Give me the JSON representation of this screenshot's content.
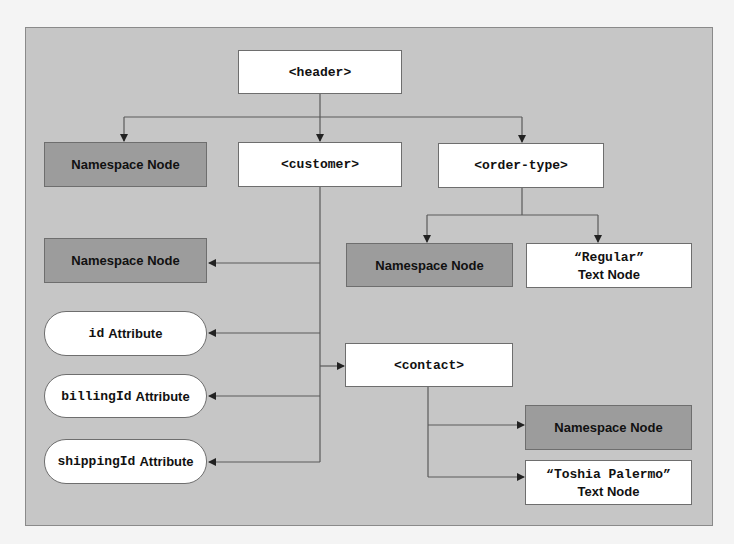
{
  "diagram": {
    "title_partial": "",
    "colors": {
      "panel": "#c6c6c6",
      "element_fill": "#ffffff",
      "namespace_fill": "#9c9c9c",
      "line": "#5a5a5a"
    },
    "nodes": {
      "header": {
        "label": "<header>",
        "type": "element"
      },
      "header_ns": {
        "label": "Namespace Node",
        "type": "namespace"
      },
      "customer": {
        "label": "<customer>",
        "type": "element"
      },
      "order_type": {
        "label": "<order-type>",
        "type": "element"
      },
      "order_type_ns": {
        "label": "Namespace Node",
        "type": "namespace"
      },
      "order_type_text": {
        "value": "“Regular”",
        "kind": "Text Node",
        "type": "text"
      },
      "customer_ns": {
        "label": "Namespace Node",
        "type": "namespace"
      },
      "id_attr": {
        "name": "id",
        "kind": "Attribute",
        "type": "attribute"
      },
      "billing_attr": {
        "name": "billingId",
        "kind": "Attribute",
        "type": "attribute"
      },
      "shipping_attr": {
        "name": "shippingId",
        "kind": "Attribute",
        "type": "attribute"
      },
      "contact": {
        "label": "<contact>",
        "type": "element"
      },
      "contact_ns": {
        "label": "Namespace Node",
        "type": "namespace"
      },
      "contact_text": {
        "value": "“Toshia Palermo”",
        "kind": "Text Node",
        "type": "text"
      }
    },
    "edges": [
      {
        "from": "header",
        "to": "header_ns"
      },
      {
        "from": "header",
        "to": "customer"
      },
      {
        "from": "header",
        "to": "order_type"
      },
      {
        "from": "order_type",
        "to": "order_type_ns"
      },
      {
        "from": "order_type",
        "to": "order_type_text"
      },
      {
        "from": "customer",
        "to": "customer_ns"
      },
      {
        "from": "customer",
        "to": "id_attr"
      },
      {
        "from": "customer",
        "to": "billing_attr"
      },
      {
        "from": "customer",
        "to": "shipping_attr"
      },
      {
        "from": "customer",
        "to": "contact"
      },
      {
        "from": "contact",
        "to": "contact_ns"
      },
      {
        "from": "contact",
        "to": "contact_text"
      }
    ]
  }
}
